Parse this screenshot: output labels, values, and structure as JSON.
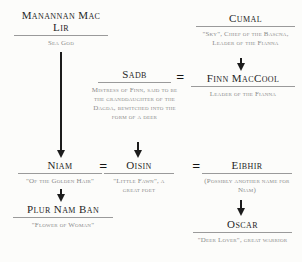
{
  "diagram": {
    "type": "family-tree",
    "equals_sign": "=",
    "nodes": [
      {
        "id": "manannan-mac-lir",
        "name": "Manannan Mac Lir",
        "caption": "Sea God"
      },
      {
        "id": "cumal",
        "name": "Cumal",
        "caption": "\"Sky\", Chief of the Bascna, Leader of the Fianna"
      },
      {
        "id": "sadb",
        "name": "Sadb",
        "caption": "Mistress of Finn, said to be the granddaughter of the Dagda, bewitched into the form of a deer"
      },
      {
        "id": "finn-maccool",
        "name": "Finn MacCool",
        "caption": "Leader of the Fianna"
      },
      {
        "id": "niam",
        "name": "Niam",
        "caption": "\"Of the Golden Hair\""
      },
      {
        "id": "oisin",
        "name": "Oisin",
        "caption": "\"Little Fawn\", a great poet"
      },
      {
        "id": "eibhir",
        "name": "Eibhir",
        "caption": "(Possibly another name for Niam)"
      },
      {
        "id": "plur-nam-ban",
        "name": "Plur Nam Ban",
        "caption": "\"Flower of Woman\""
      },
      {
        "id": "oscar",
        "name": "Oscar",
        "caption": "\"Deer Lover\", great warrior"
      }
    ],
    "relationships": {
      "marriages": [
        [
          "Sadb",
          "Finn MacCool"
        ],
        [
          "Niam",
          "Oisin"
        ],
        [
          "Oisin",
          "Eibhir"
        ]
      ],
      "descents": [
        [
          "Manannan Mac Lir",
          "Niam"
        ],
        [
          "Cumal",
          "Finn MacCool"
        ],
        [
          "Sadb",
          "Oisin"
        ],
        [
          "Niam",
          "Plur Nam Ban"
        ],
        [
          "Eibhir",
          "Oscar"
        ]
      ]
    },
    "colors": {
      "name_text": "#1f1f1f",
      "caption_text": "#8b8b8b",
      "rule": "#9a9a9a",
      "arrow": "#1c1c1c",
      "background": "#fcfcfa"
    }
  }
}
